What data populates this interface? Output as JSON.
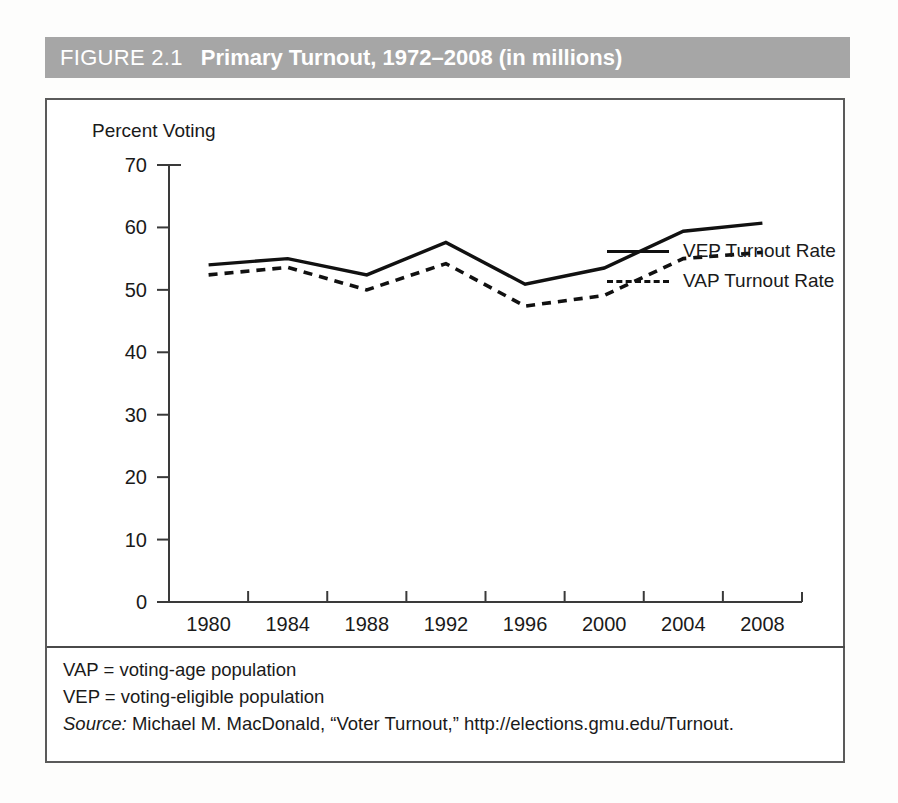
{
  "header": {
    "figure_number": "FIGURE 2.1",
    "title": "Primary Turnout, 1972–2008 (in millions)",
    "bar_color": "#a6a6a6"
  },
  "legend": {
    "position": "top-right",
    "items": [
      {
        "label": "VEP Turnout Rate",
        "style": "solid",
        "color": "#111111",
        "icon": "solid-line-icon"
      },
      {
        "label": "VAP Turnout Rate",
        "style": "dashed",
        "color": "#111111",
        "icon": "dashed-line-icon"
      }
    ]
  },
  "footnotes": [
    {
      "text": "VAP = voting-age population"
    },
    {
      "text": "VEP = voting-eligible population"
    }
  ],
  "source": {
    "label": "Source:",
    "text": " Michael M. MacDonald, “Voter Turnout,” http://elections.gmu.edu/Turnout."
  },
  "chart_data": {
    "type": "line",
    "title": "Primary Turnout, 1972–2008 (in millions)",
    "xlabel": "",
    "ylabel": "Percent Voting",
    "categories": [
      "1980",
      "1984",
      "1988",
      "1992",
      "1996",
      "2000",
      "2004",
      "2008"
    ],
    "yticks": [
      0,
      10,
      20,
      30,
      40,
      50,
      60,
      70
    ],
    "xticks": [
      "1980",
      "1984",
      "1988",
      "1992",
      "1996",
      "2000",
      "2004",
      "2008"
    ],
    "ylim": [
      0,
      70
    ],
    "grid": false,
    "legend_position": "top-right",
    "series": [
      {
        "name": "VEP Turnout Rate",
        "style": "solid",
        "color": "#111111",
        "values": [
          54.0,
          55.0,
          52.4,
          57.6,
          50.9,
          53.5,
          59.4,
          60.7
        ]
      },
      {
        "name": "VAP Turnout Rate",
        "style": "dashed",
        "color": "#111111",
        "values": [
          52.4,
          53.6,
          50.0,
          54.2,
          47.4,
          49.1,
          55.0,
          56.0
        ]
      }
    ]
  }
}
